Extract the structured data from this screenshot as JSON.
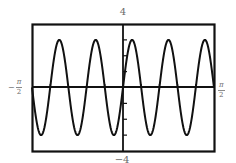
{
  "chart_data": {
    "type": "line",
    "title": "",
    "function": "y = 3 sin(10x)",
    "series": [
      {
        "name": "3 sin(10x)",
        "amplitude": 3,
        "angular_frequency": 10,
        "period": "π/5",
        "x_samples": [
          -1.5708,
          -1.4137,
          -1.2566,
          -1.0996,
          -0.9425,
          -0.7854,
          -0.6283,
          -0.4712,
          -0.3142,
          -0.1571,
          0,
          0.1571,
          0.3142,
          0.4712,
          0.6283,
          0.7854,
          0.9425,
          1.0996,
          1.2566,
          1.4137,
          1.5708
        ],
        "peaks_x": [
          "-3π/20",
          "-7π/20",
          "-11π/20 (out of frame)",
          "π/20",
          "9π/20"
        ],
        "peak_count_visible": 5,
        "trough_count_visible": 5
      }
    ],
    "xlim": [
      -1.5708,
      1.5708
    ],
    "ylim": [
      -4,
      4
    ],
    "x_tick_labels": [
      "-π/2",
      "π/2"
    ],
    "y_tick_labels": [
      "4",
      "-4"
    ],
    "xlabel": "",
    "ylabel": "",
    "grid": false,
    "legend": "none",
    "frame": true
  },
  "labels": {
    "y_max": "4",
    "y_min": "−4",
    "x_min_sign": "−",
    "x_min_num": "π",
    "x_min_den": "2",
    "x_max_num": "π",
    "x_max_den": "2"
  },
  "colors": {
    "curve": "#111111",
    "axes": "#111111",
    "frame": "#111111",
    "label": "#6a6a6a",
    "background": "#ffffff"
  }
}
